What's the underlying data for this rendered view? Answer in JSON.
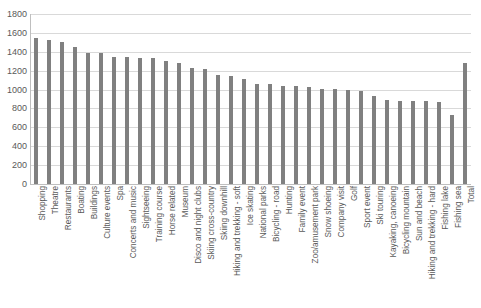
{
  "chart_data": {
    "type": "bar",
    "title": "",
    "subtitle": "",
    "xlabel": "",
    "ylabel": "",
    "ylim": [
      0,
      1800
    ],
    "ytick_step": 200,
    "yticks": [
      1800,
      1600,
      1400,
      1200,
      1000,
      800,
      600,
      400,
      200,
      0
    ],
    "grid": "horizontal",
    "legend": "none",
    "bar_color": "#808080",
    "gridline_color": "#d9d9d9",
    "axis_color": "#bfbfbf",
    "tick_label_color": "#595959",
    "categories": [
      "Shopping",
      "Theatre",
      "Restaurants",
      "Boating",
      "Buildings",
      "Culture events",
      "Spa",
      "Concerts and music",
      "Sightseeing",
      "Training course",
      "Horse related",
      "Museum",
      "Disco and night clubs",
      "Skiing cross-country",
      "Skiing downhill",
      "Hiking and trekking - soft",
      "Ice skating",
      "National parks",
      "Bicycling - road",
      "Hunting",
      "Family event",
      "Zoo/amusement park",
      "Snow shoeing",
      "Company visit",
      "Golf",
      "Sport event",
      "Ski touring",
      "Kayaking, canoeing",
      "Bicycling mountain",
      "Sun and beach",
      "Hiking and trekking - hard",
      "Fishing lake",
      "Fishing sea",
      "Total"
    ],
    "values": [
      1550,
      1530,
      1500,
      1455,
      1385,
      1385,
      1350,
      1350,
      1335,
      1330,
      1300,
      1280,
      1230,
      1215,
      1150,
      1145,
      1110,
      1060,
      1060,
      1040,
      1040,
      1030,
      1010,
      1005,
      1000,
      990,
      935,
      890,
      880,
      880,
      875,
      870,
      730,
      1280
    ]
  }
}
